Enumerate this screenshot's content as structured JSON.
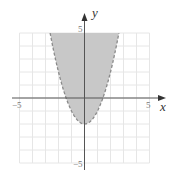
{
  "chart_data": {
    "type": "area",
    "title": "",
    "inequality": "y > x^2 - 2",
    "boundary": {
      "equation": "y = x^2 - 2",
      "style": "dashed",
      "vertex": [
        0,
        -2
      ]
    },
    "shaded_region": "above parabola (inside)",
    "xlabel": "x",
    "ylabel": "y",
    "xlim": [
      -5,
      5
    ],
    "ylim": [
      -5,
      5
    ],
    "grid": true,
    "grid_step": 1,
    "tick_labels": {
      "x": [
        "-5",
        "5"
      ],
      "y": [
        "5",
        "-5"
      ]
    },
    "colors": {
      "shade": "#c8c8c8",
      "boundary": "#8a8a8a",
      "grid": "#e6e6e6",
      "axis": "#444444"
    }
  },
  "labels": {
    "x_axis": "x",
    "y_axis": "y",
    "x_neg": "−5",
    "x_pos": "5",
    "y_pos": "5",
    "y_neg": "−5"
  }
}
